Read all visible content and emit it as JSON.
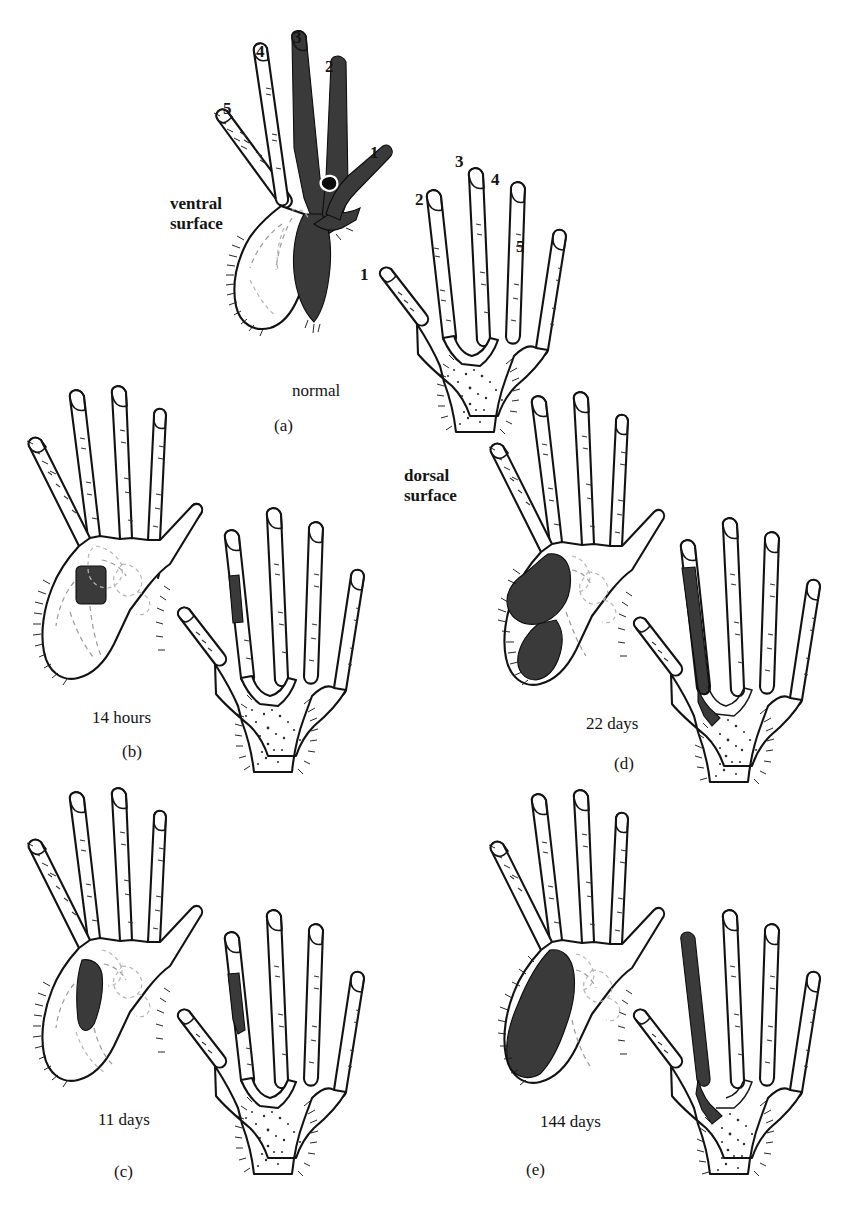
{
  "figure": {
    "kind": "anatomical-illustration",
    "shade_color": "#3a3a3a",
    "shade_color_dark": "#2b2b2b",
    "outline_color": "#121212",
    "background": "#ffffff"
  },
  "surface_labels": {
    "ventral": "ventral\nsurface",
    "dorsal": "dorsal\nsurface"
  },
  "digit_labels": {
    "ventral_hand": [
      "5",
      "4",
      "3",
      "2",
      "1"
    ],
    "dorsal_hand": [
      "1",
      "2",
      "3",
      "4",
      "5"
    ]
  },
  "panels": [
    {
      "id": "a",
      "panel_label": "(a)",
      "time_label": "normal",
      "shaded_ventral": "digits 1, 2 and 3 plus adjoining palm fully shaded",
      "shaded_dorsal": "none"
    },
    {
      "id": "b",
      "panel_label": "(b)",
      "time_label": "14 hours",
      "shaded_ventral": "small square patch on mid palm",
      "shaded_dorsal": "short band on middle segment of digit 2"
    },
    {
      "id": "c",
      "panel_label": "(c)",
      "time_label": "11 days",
      "shaded_ventral": "narrow vertical strip on palm",
      "shaded_dorsal": "small band on distal-middle digit 2"
    },
    {
      "id": "d",
      "panel_label": "(d)",
      "time_label": "22 days",
      "shaded_ventral": "enlarged irregular patch extending to thenar border",
      "shaded_dorsal": "long band covering most of digit 2"
    },
    {
      "id": "e",
      "panel_label": "(e)",
      "time_label": "144 days",
      "shaded_ventral": "large lobed region filling radial half of palm",
      "shaded_dorsal": "full-length band covering digit 2 to the tip"
    }
  ]
}
